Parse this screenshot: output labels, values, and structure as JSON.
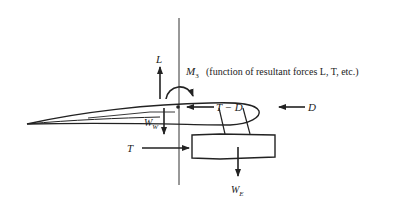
{
  "diagram": {
    "type": "free-body force diagram",
    "colors": {
      "line": "#222222",
      "background": "#ffffff"
    },
    "labels": {
      "lift": "L",
      "moment_symbol": "M",
      "moment_subscript": "3",
      "moment_note": "(function of resultant forces L, T, etc.)",
      "thrust_minus_drag": "T − D",
      "drag": "D",
      "wing_weight_symbol": "W",
      "wing_weight_subscript": "W",
      "thrust": "T",
      "engine_weight_symbol": "W",
      "engine_weight_subscript": "E"
    },
    "forces": [
      {
        "name": "lift",
        "label": "L",
        "direction": "up"
      },
      {
        "name": "moment",
        "label": "M3",
        "direction": "clockwise"
      },
      {
        "name": "thrust-minus-drag",
        "label": "T − D",
        "direction": "left"
      },
      {
        "name": "drag",
        "label": "D",
        "direction": "left"
      },
      {
        "name": "wing-weight",
        "label": "W_W",
        "direction": "down"
      },
      {
        "name": "thrust",
        "label": "T",
        "direction": "right"
      },
      {
        "name": "engine-weight",
        "label": "W_E",
        "direction": "down"
      }
    ]
  }
}
